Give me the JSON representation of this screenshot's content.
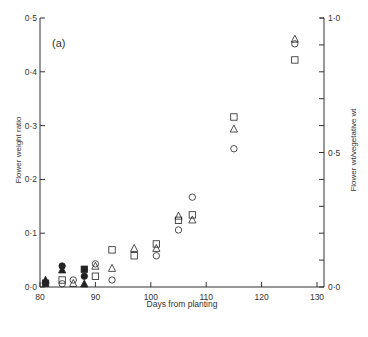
{
  "chart_data": {
    "type": "scatter",
    "panel_label": "(a)",
    "title": "",
    "xlabel": "Days from planting",
    "ylabel": "Flower weight ratio",
    "ylabel_right": "Flower wt/vegetative wt",
    "xlim": [
      80,
      130
    ],
    "ylim": [
      0.0,
      0.5
    ],
    "ylim_right": [
      0.0,
      1.0
    ],
    "x_ticks": [
      80,
      90,
      100,
      110,
      120,
      130
    ],
    "x_tick_labels": [
      "80",
      "90",
      "100",
      "110",
      "120",
      "130"
    ],
    "y_ticks": [
      0.0,
      0.1,
      0.2,
      0.3,
      0.4,
      0.5
    ],
    "y_tick_labels": [
      "0·0",
      "0·1",
      "0·2",
      "0·3",
      "0·4",
      "0·5"
    ],
    "y_right_ticks": [
      0.0,
      0.5,
      1.0
    ],
    "y_right_tick_labels": [
      "0·0",
      "0·5",
      "1·0"
    ],
    "y_right_minor_step": 0.1,
    "grid": false,
    "legend": "none",
    "series": [
      {
        "name": "open square",
        "marker": "square",
        "filled": false,
        "points": [
          [
            84,
            0.013
          ],
          [
            90,
            0.02
          ],
          [
            93,
            0.069
          ],
          [
            97,
            0.058
          ],
          [
            101,
            0.08
          ],
          [
            105,
            0.124
          ],
          [
            107.5,
            0.134
          ],
          [
            115,
            0.316
          ],
          [
            126,
            0.422
          ]
        ]
      },
      {
        "name": "open triangle",
        "marker": "triangle",
        "filled": false,
        "points": [
          [
            86,
            0.007
          ],
          [
            90,
            0.039
          ],
          [
            93,
            0.035
          ],
          [
            97,
            0.072
          ],
          [
            101,
            0.072
          ],
          [
            105,
            0.132
          ],
          [
            107.5,
            0.125
          ],
          [
            115,
            0.294
          ],
          [
            126,
            0.461
          ]
        ]
      },
      {
        "name": "open circle",
        "marker": "circle",
        "filled": false,
        "points": [
          [
            84,
            0.006
          ],
          [
            86,
            0.013
          ],
          [
            90,
            0.043
          ],
          [
            93,
            0.013
          ],
          [
            101,
            0.058
          ],
          [
            105,
            0.106
          ],
          [
            107.5,
            0.167
          ],
          [
            115,
            0.257
          ],
          [
            126,
            0.452
          ]
        ]
      },
      {
        "name": "filled triangle",
        "marker": "triangle",
        "filled": true,
        "points": [
          [
            81,
            0.013
          ],
          [
            84,
            0.032
          ],
          [
            88,
            0.006
          ]
        ]
      },
      {
        "name": "filled square",
        "marker": "square",
        "filled": true,
        "points": [
          [
            81,
            0.007
          ],
          [
            88,
            0.033
          ]
        ]
      },
      {
        "name": "filled circle",
        "marker": "circle",
        "filled": true,
        "points": [
          [
            84,
            0.039
          ],
          [
            88,
            0.02
          ]
        ]
      }
    ]
  },
  "colors": {
    "axis": "#333333",
    "marker": "#222222"
  }
}
